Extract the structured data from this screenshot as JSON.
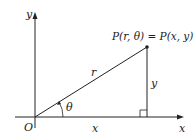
{
  "diagram": {
    "axes": {
      "x_label": "x",
      "y_label": "y",
      "origin_label": "O"
    },
    "point_label": "P(r, θ) = P(x, y)",
    "segments": {
      "hypotenuse": "r",
      "vertical": "y",
      "horizontal": "x"
    },
    "angle_label": "θ",
    "colors": {
      "line": "#222222",
      "background": "#ffffff"
    }
  }
}
